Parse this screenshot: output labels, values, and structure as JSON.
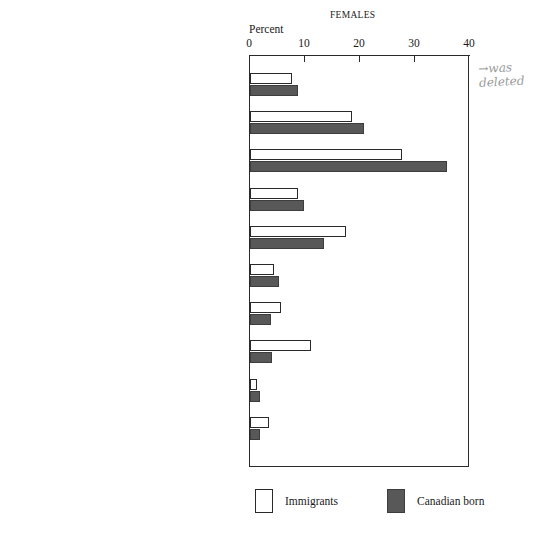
{
  "chart_data": {
    "type": "bar",
    "orientation": "horizontal",
    "title": "FEMALES",
    "xlabel": "Percent",
    "ylabel": "",
    "xlim": [
      0,
      40
    ],
    "xticks": [
      0,
      10,
      20,
      30,
      40
    ],
    "grid": false,
    "legend_position": "bottom",
    "categories": [
      "Managerial, Administrative, and related",
      "Professional and related",
      "Clerical and related",
      "Sales",
      "Service",
      "Primary",
      "Processing",
      "Product fabricating, assembling, and repairing",
      "Construction",
      "Other"
    ],
    "series": [
      {
        "name": "Immigrants",
        "color": "#ffffff",
        "values": [
          7.6,
          18.5,
          27.6,
          8.7,
          17.5,
          4.4,
          5.6,
          11.0,
          1.3,
          3.5
        ]
      },
      {
        "name": "Canadian born",
        "color": "#585858",
        "values": [
          8.7,
          20.7,
          35.8,
          9.8,
          13.5,
          5.3,
          3.8,
          4.0,
          1.9,
          1.9
        ]
      }
    ]
  },
  "annotation": {
    "arrow": "→",
    "line1": "was",
    "line2": "deleted"
  }
}
